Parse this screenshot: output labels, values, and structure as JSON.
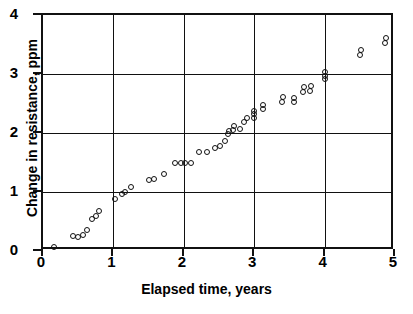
{
  "chart_data": {
    "type": "scatter",
    "title": "",
    "xlabel": "Elapsed time, years",
    "ylabel": "Change in resistance, ppm",
    "xlim": [
      0,
      5
    ],
    "ylim": [
      0,
      4
    ],
    "xticks": [
      0,
      1,
      2,
      3,
      4,
      5
    ],
    "yticks": [
      0,
      1,
      2,
      3,
      4
    ],
    "xticklabels": [
      "0",
      "1",
      "2",
      "3",
      "4",
      "5"
    ],
    "yticklabels": [
      "0",
      "1",
      "2",
      "3",
      "4"
    ],
    "grid": true,
    "grid_style": "solid-black-major",
    "legend": "none",
    "marker": "open-circle",
    "marker_color": "#111111",
    "series": [
      {
        "name": "Resistor drift",
        "points": [
          [
            0.15,
            0.07
          ],
          [
            0.42,
            0.25
          ],
          [
            0.5,
            0.23
          ],
          [
            0.57,
            0.27
          ],
          [
            0.63,
            0.36
          ],
          [
            0.7,
            0.54
          ],
          [
            0.75,
            0.59
          ],
          [
            0.8,
            0.68
          ],
          [
            1.02,
            0.88
          ],
          [
            1.12,
            0.97
          ],
          [
            1.17,
            1.0
          ],
          [
            1.25,
            1.08
          ],
          [
            1.5,
            1.2
          ],
          [
            1.57,
            1.22
          ],
          [
            1.72,
            1.3
          ],
          [
            1.88,
            1.5
          ],
          [
            1.96,
            1.5
          ],
          [
            2.02,
            1.5
          ],
          [
            2.1,
            1.5
          ],
          [
            2.22,
            1.67
          ],
          [
            2.33,
            1.67
          ],
          [
            2.44,
            1.75
          ],
          [
            2.52,
            1.78
          ],
          [
            2.58,
            1.86
          ],
          [
            2.63,
            1.98
          ],
          [
            2.64,
            2.03
          ],
          [
            2.7,
            2.05
          ],
          [
            2.72,
            2.12
          ],
          [
            2.8,
            2.06
          ],
          [
            2.86,
            2.19
          ],
          [
            2.9,
            2.25
          ],
          [
            3.0,
            2.26
          ],
          [
            3.0,
            2.32
          ],
          [
            3.0,
            2.38
          ],
          [
            3.12,
            2.4
          ],
          [
            3.13,
            2.47
          ],
          [
            3.4,
            2.53
          ],
          [
            3.41,
            2.61
          ],
          [
            3.56,
            2.52
          ],
          [
            3.57,
            2.6
          ],
          [
            3.7,
            2.7
          ],
          [
            3.71,
            2.78
          ],
          [
            3.79,
            2.72
          ],
          [
            3.8,
            2.8
          ],
          [
            4.0,
            2.91
          ],
          [
            4.0,
            2.97
          ],
          [
            4.0,
            3.03
          ],
          [
            4.5,
            3.32
          ],
          [
            4.51,
            3.4
          ],
          [
            4.86,
            3.53
          ],
          [
            4.87,
            3.61
          ]
        ]
      }
    ]
  }
}
